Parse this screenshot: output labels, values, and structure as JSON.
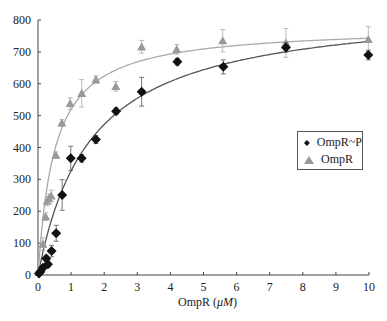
{
  "chart_data": {
    "type": "scatter",
    "title": "",
    "xlabel": "OmpR (μM)",
    "xlabel_parts": {
      "prefix": "OmpR  (",
      "unit": "μM",
      "suffix": ")"
    },
    "ylabel": "",
    "xlim": [
      0,
      10
    ],
    "ylim": [
      0,
      800
    ],
    "xticks": [
      0,
      1,
      2,
      3,
      4,
      5,
      6,
      7,
      8,
      9,
      10
    ],
    "yticks": [
      0,
      100,
      200,
      300,
      400,
      500,
      600,
      700,
      800
    ],
    "grid": false,
    "legend_position": "right-center",
    "series": [
      {
        "name": "OmpR~P",
        "marker": "diamond",
        "color": "#111111",
        "fit_color": "#555555",
        "fit": {
          "model": "hyperbolic",
          "Bmax": 850,
          "Kd": 1.6
        },
        "points": [
          {
            "x": 0.03,
            "y": 5,
            "err": 5
          },
          {
            "x": 0.07,
            "y": 10,
            "err": 6
          },
          {
            "x": 0.15,
            "y": 23,
            "err": 8
          },
          {
            "x": 0.25,
            "y": 52,
            "err": 10
          },
          {
            "x": 0.3,
            "y": 34,
            "err": 10
          },
          {
            "x": 0.41,
            "y": 75,
            "err": 18
          },
          {
            "x": 0.55,
            "y": 131,
            "err": 25
          },
          {
            "x": 0.73,
            "y": 251,
            "err": 48
          },
          {
            "x": 0.99,
            "y": 366,
            "err": 38
          },
          {
            "x": 1.32,
            "y": 366,
            "err": 12
          },
          {
            "x": 1.75,
            "y": 425,
            "err": 12
          },
          {
            "x": 2.36,
            "y": 514,
            "err": 10
          },
          {
            "x": 3.13,
            "y": 575,
            "err": 45
          },
          {
            "x": 4.21,
            "y": 669,
            "err": 10
          },
          {
            "x": 5.6,
            "y": 653,
            "err": 22
          },
          {
            "x": 7.49,
            "y": 714,
            "err": 15
          },
          {
            "x": 9.98,
            "y": 690,
            "err": 15
          }
        ]
      },
      {
        "name": "OmpR",
        "marker": "triangle",
        "color": "#999999",
        "fit_color": "#aaaaaa",
        "fit": {
          "model": "hyperbolic",
          "Bmax": 780,
          "Kd": 0.5
        },
        "points": [
          {
            "x": 0.03,
            "y": 8,
            "err": 5
          },
          {
            "x": 0.08,
            "y": 20,
            "err": 6
          },
          {
            "x": 0.15,
            "y": 97,
            "err": 20
          },
          {
            "x": 0.23,
            "y": 183,
            "err": 12
          },
          {
            "x": 0.28,
            "y": 232,
            "err": 15
          },
          {
            "x": 0.33,
            "y": 240,
            "err": 15
          },
          {
            "x": 0.4,
            "y": 248,
            "err": 18
          },
          {
            "x": 0.54,
            "y": 376,
            "err": 10
          },
          {
            "x": 0.72,
            "y": 477,
            "err": 10
          },
          {
            "x": 0.97,
            "y": 538,
            "err": 18
          },
          {
            "x": 1.32,
            "y": 570,
            "err": 43
          },
          {
            "x": 1.75,
            "y": 613,
            "err": 12
          },
          {
            "x": 2.35,
            "y": 592,
            "err": 15
          },
          {
            "x": 3.13,
            "y": 716,
            "err": 20
          },
          {
            "x": 4.19,
            "y": 708,
            "err": 15
          },
          {
            "x": 5.58,
            "y": 735,
            "err": 35
          },
          {
            "x": 7.49,
            "y": 728,
            "err": 45
          },
          {
            "x": 9.98,
            "y": 739,
            "err": 40
          }
        ]
      }
    ]
  },
  "legend": {
    "items": [
      {
        "label": "OmpR~P",
        "marker": "diamond",
        "color": "#111111"
      },
      {
        "label": "OmpR",
        "marker": "triangle",
        "color": "#999999"
      }
    ]
  }
}
